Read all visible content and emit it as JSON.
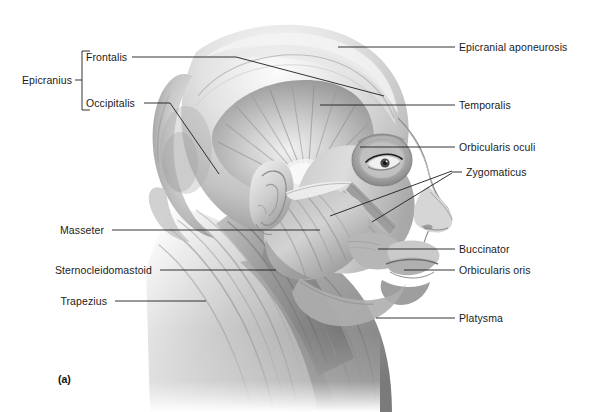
{
  "figure": {
    "caption": "(a)",
    "background_color": "#ffffff",
    "text_color": "#1b1b1b",
    "leader_color": "#1d1d1d"
  },
  "grouping": {
    "bracket_label": "Epicranius",
    "members": [
      "Frontalis",
      "Occipitalis"
    ]
  },
  "labels": {
    "epicranius": "Epicranius",
    "frontalis": "Frontalis",
    "occipitalis": "Occipitalis",
    "masseter": "Masseter",
    "sternocleidomastoid": "Sternocleidomastoid",
    "trapezius": "Trapezius",
    "epicranial_aponeurosis": "Epicranial aponeurosis",
    "temporalis": "Temporalis",
    "orbicularis_oculi": "Orbicularis oculi",
    "zygomaticus": "Zygomaticus",
    "buccinator": "Buccinator",
    "orbicularis_oris": "Orbicularis oris",
    "platysma": "Platysma"
  },
  "illustration": {
    "subject": "human head and neck, lateral (side) view with superficial musculature",
    "style": "grayscale airbrush medical illustration",
    "parts": [
      "epicranial-aponeurosis",
      "occipitalis",
      "temporalis",
      "orbicularis-oculi",
      "zygomaticus",
      "masseter",
      "buccinator",
      "orbicularis-oris",
      "sternocleidomastoid",
      "trapezius",
      "platysma",
      "ear",
      "eye",
      "nose",
      "lips"
    ]
  }
}
